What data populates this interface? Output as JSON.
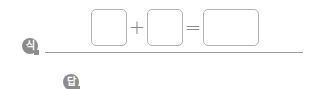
{
  "equation": {
    "badge_label": "식",
    "operand_1": "",
    "operator_1": "+",
    "operand_2": "",
    "operator_2": "=",
    "result": ""
  },
  "answer": {
    "badge_label": "답",
    "value": ""
  },
  "colors": {
    "badge": "#8c8c8c",
    "box_border": "#b4b4b4",
    "operator": "#8a8a8a",
    "rule": "#9a9a9a"
  }
}
